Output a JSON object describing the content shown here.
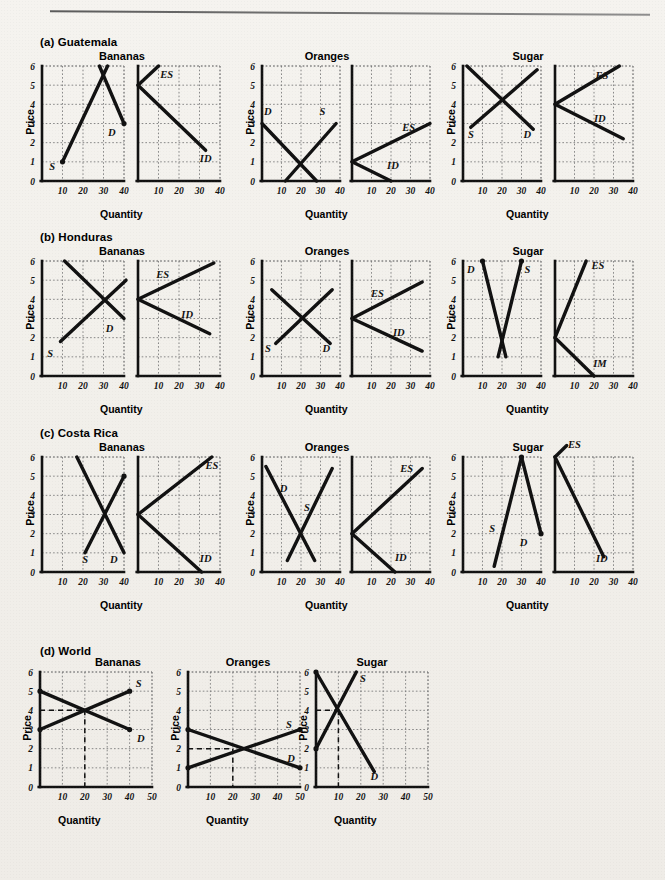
{
  "figure": {
    "top_rule": true,
    "rows": [
      {
        "id": "a",
        "label": "(a) Guatemala",
        "groups": [
          {
            "title": "Bananas",
            "xlabel": "Quantity",
            "ylabel": "Price"
          },
          {
            "title": "Oranges",
            "xlabel": "Quantity",
            "ylabel": "Price"
          },
          {
            "title": "Sugar",
            "xlabel": "Quantity",
            "ylabel": "Price"
          }
        ]
      },
      {
        "id": "b",
        "label": "(b) Honduras",
        "groups": [
          {
            "title": "Bananas",
            "xlabel": "Quantity",
            "ylabel": "Price"
          },
          {
            "title": "Oranges",
            "xlabel": "Quantity",
            "ylabel": "Price"
          },
          {
            "title": "Sugar",
            "xlabel": "Quantity",
            "ylabel": "Price"
          }
        ]
      },
      {
        "id": "c",
        "label": "(c) Costa Rica",
        "groups": [
          {
            "title": "Bananas",
            "xlabel": "Quantity",
            "ylabel": "Price"
          },
          {
            "title": "Oranges",
            "xlabel": "Quantity",
            "ylabel": "Price"
          },
          {
            "title": "Sugar",
            "xlabel": "Quantity",
            "ylabel": "Price"
          }
        ]
      },
      {
        "id": "d",
        "label": "(d) World",
        "groups": [
          {
            "title": "Bananas",
            "xlabel": "Quantity",
            "ylabel": "Price"
          },
          {
            "title": "Oranges",
            "xlabel": "Quantity",
            "ylabel": "Price"
          },
          {
            "title": "Sugar",
            "xlabel": "Quantity",
            "ylabel": "Price"
          }
        ]
      }
    ],
    "axes": {
      "yticks": [
        0,
        1,
        2,
        3,
        4,
        5,
        6
      ],
      "xticks_40": [
        10,
        20,
        30,
        40
      ],
      "xticks_50": [
        10,
        20,
        30,
        40,
        50
      ]
    },
    "curve_labels": {
      "S": "S",
      "D": "D",
      "ES": "ES",
      "ID": "ID",
      "IM": "IM"
    },
    "colors": {
      "ink": "#111111",
      "grid": "#7c7c7c",
      "paper": "#f2f0eb"
    }
  },
  "chart_data": {
    "type": "line",
    "xlabel": "Quantity",
    "ylabel": "Price",
    "ylim": [
      0,
      6
    ],
    "xlim_country": [
      0,
      40
    ],
    "xlim_world": [
      0,
      50
    ],
    "grid": true,
    "panels": [
      {
        "row": "(a) Guatemala",
        "good": "Bananas",
        "kind": "domestic",
        "xlim": [
          0,
          40
        ],
        "series": [
          {
            "name": "S",
            "label": "S",
            "points": [
              [
                10,
                1
              ],
              [
                32,
                6
              ]
            ]
          },
          {
            "name": "D",
            "label": "D",
            "points": [
              [
                28,
                6
              ],
              [
                40,
                3
              ]
            ]
          }
        ],
        "equilibrium": [
          30,
          5
        ]
      },
      {
        "row": "(a) Guatemala",
        "good": "Bananas",
        "kind": "trade",
        "xlim": [
          0,
          40
        ],
        "series": [
          {
            "name": "ES",
            "label": "ES",
            "points": [
              [
                0,
                5
              ],
              [
                10,
                6
              ]
            ]
          },
          {
            "name": "ID",
            "label": "ID",
            "points": [
              [
                0,
                5
              ],
              [
                33,
                1.6
              ]
            ]
          }
        ],
        "autarky_price": 5
      },
      {
        "row": "(a) Guatemala",
        "good": "Oranges",
        "kind": "domestic",
        "xlim": [
          0,
          40
        ],
        "series": [
          {
            "name": "D",
            "label": "D",
            "points": [
              [
                0,
                3
              ],
              [
                28,
                0
              ]
            ]
          },
          {
            "name": "S",
            "label": "S",
            "points": [
              [
                12,
                0
              ],
              [
                38,
                3
              ]
            ]
          }
        ],
        "equilibrium": [
          20,
          1
        ]
      },
      {
        "row": "(a) Guatemala",
        "good": "Oranges",
        "kind": "trade",
        "xlim": [
          0,
          40
        ],
        "series": [
          {
            "name": "ES",
            "label": "ES",
            "points": [
              [
                0,
                1
              ],
              [
                40,
                3
              ]
            ]
          },
          {
            "name": "ID",
            "label": "ID",
            "points": [
              [
                0,
                1
              ],
              [
                20,
                0
              ]
            ]
          }
        ],
        "autarky_price": 1
      },
      {
        "row": "(a) Guatemala",
        "good": "Sugar",
        "kind": "domestic",
        "xlim": [
          0,
          40
        ],
        "series": [
          {
            "name": "D",
            "label": "D",
            "points": [
              [
                2,
                6
              ],
              [
                36,
                2.7
              ]
            ]
          },
          {
            "name": "S",
            "label": "S",
            "points": [
              [
                4,
                2.8
              ],
              [
                38,
                5.8
              ]
            ]
          }
        ],
        "equilibrium": [
          20,
          4
        ]
      },
      {
        "row": "(a) Guatemala",
        "good": "Sugar",
        "kind": "trade",
        "xlim": [
          0,
          40
        ],
        "series": [
          {
            "name": "ES",
            "label": "ES",
            "points": [
              [
                0,
                4
              ],
              [
                33,
                6
              ]
            ]
          },
          {
            "name": "ID",
            "label": "ID",
            "points": [
              [
                0,
                4
              ],
              [
                35,
                2.2
              ]
            ]
          }
        ],
        "autarky_price": 4
      },
      {
        "row": "(b) Honduras",
        "good": "Bananas",
        "kind": "domestic",
        "xlim": [
          0,
          40
        ],
        "series": [
          {
            "name": "D",
            "label": "D",
            "points": [
              [
                11,
                6
              ],
              [
                40,
                3
              ]
            ]
          },
          {
            "name": "S",
            "label": "S",
            "points": [
              [
                9,
                1.8
              ],
              [
                41,
                5
              ]
            ]
          }
        ],
        "equilibrium": [
          30,
          4
        ]
      },
      {
        "row": "(b) Honduras",
        "good": "Bananas",
        "kind": "trade",
        "xlim": [
          0,
          40
        ],
        "series": [
          {
            "name": "ES",
            "label": "ES",
            "points": [
              [
                0,
                4
              ],
              [
                37,
                5.9
              ]
            ]
          },
          {
            "name": "ID",
            "label": "ID",
            "points": [
              [
                0,
                4
              ],
              [
                35,
                2.2
              ]
            ]
          }
        ],
        "autarky_price": 4
      },
      {
        "row": "(b) Honduras",
        "good": "Oranges",
        "kind": "domestic",
        "xlim": [
          0,
          40
        ],
        "series": [
          {
            "name": "D",
            "label": "D",
            "points": [
              [
                5,
                4.5
              ],
              [
                35,
                1.7
              ]
            ]
          },
          {
            "name": "S",
            "label": "S",
            "points": [
              [
                7,
                1.7
              ],
              [
                36,
                4.5
              ]
            ]
          }
        ],
        "equilibrium": [
          20,
          3
        ]
      },
      {
        "row": "(b) Honduras",
        "good": "Oranges",
        "kind": "trade",
        "xlim": [
          0,
          40
        ],
        "series": [
          {
            "name": "ES",
            "label": "ES",
            "points": [
              [
                0,
                3
              ],
              [
                36,
                4.9
              ]
            ]
          },
          {
            "name": "ID",
            "label": "ID",
            "points": [
              [
                0,
                3
              ],
              [
                36,
                1.3
              ]
            ]
          }
        ],
        "autarky_price": 3
      },
      {
        "row": "(b) Honduras",
        "good": "Sugar",
        "kind": "domestic",
        "xlim": [
          0,
          40
        ],
        "series": [
          {
            "name": "D",
            "label": "D",
            "points": [
              [
                10,
                6
              ],
              [
                22,
                1
              ]
            ]
          },
          {
            "name": "S",
            "label": "S",
            "points": [
              [
                30,
                6
              ],
              [
                18,
                1
              ]
            ]
          }
        ],
        "equilibrium": [
          20,
          2
        ]
      },
      {
        "row": "(b) Honduras",
        "good": "Sugar",
        "kind": "trade",
        "xlim": [
          0,
          40
        ],
        "series": [
          {
            "name": "ES",
            "label": "ES",
            "points": [
              [
                0,
                2
              ],
              [
                16,
                6
              ]
            ]
          },
          {
            "name": "IM",
            "label": "IM",
            "points": [
              [
                0,
                2
              ],
              [
                20,
                0
              ]
            ]
          }
        ],
        "autarky_price": 2
      },
      {
        "row": "(c) Costa Rica",
        "good": "Bananas",
        "kind": "domestic",
        "xlim": [
          0,
          40
        ],
        "series": [
          {
            "name": "D",
            "label": "D",
            "points": [
              [
                17,
                6
              ],
              [
                40,
                1
              ]
            ]
          },
          {
            "name": "S",
            "label": "S",
            "points": [
              [
                21,
                1
              ],
              [
                40,
                5
              ]
            ]
          }
        ],
        "equilibrium": [
          30,
          3
        ]
      },
      {
        "row": "(c) Costa Rica",
        "good": "Bananas",
        "kind": "trade",
        "xlim": [
          0,
          40
        ],
        "series": [
          {
            "name": "ES",
            "label": "ES",
            "points": [
              [
                0,
                3
              ],
              [
                36,
                6
              ]
            ]
          },
          {
            "name": "ID",
            "label": "ID",
            "points": [
              [
                0,
                3
              ],
              [
                31,
                0
              ]
            ]
          }
        ],
        "autarky_price": 3
      },
      {
        "row": "(c) Costa Rica",
        "good": "Oranges",
        "kind": "domestic",
        "xlim": [
          0,
          40
        ],
        "series": [
          {
            "name": "D",
            "label": "D",
            "points": [
              [
                2,
                5.5
              ],
              [
                27,
                0.6
              ]
            ]
          },
          {
            "name": "S",
            "label": "S",
            "points": [
              [
                13,
                0.6
              ],
              [
                36,
                5.4
              ]
            ]
          }
        ],
        "equilibrium": [
          20,
          2
        ]
      },
      {
        "row": "(c) Costa Rica",
        "good": "Oranges",
        "kind": "trade",
        "xlim": [
          0,
          40
        ],
        "series": [
          {
            "name": "ES",
            "label": "ES",
            "points": [
              [
                0,
                2
              ],
              [
                36,
                5.4
              ]
            ]
          },
          {
            "name": "ID",
            "label": "ID",
            "points": [
              [
                0,
                2
              ],
              [
                22,
                0
              ]
            ]
          }
        ],
        "autarky_price": 2
      },
      {
        "row": "(c) Costa Rica",
        "good": "Sugar",
        "kind": "domestic",
        "xlim": [
          0,
          40
        ],
        "series": [
          {
            "name": "S",
            "label": "S",
            "points": [
              [
                16,
                0.3
              ],
              [
                30,
                6
              ]
            ]
          },
          {
            "name": "D",
            "label": "D",
            "points": [
              [
                30,
                6
              ],
              [
                40,
                2
              ]
            ]
          }
        ],
        "equilibrium": [
          30,
          6
        ]
      },
      {
        "row": "(c) Costa Rica",
        "good": "Sugar",
        "kind": "trade",
        "xlim": [
          0,
          40
        ],
        "series": [
          {
            "name": "ES",
            "label": "ES",
            "points": [
              [
                0,
                6
              ],
              [
                6,
                6.6
              ]
            ]
          },
          {
            "name": "ID",
            "label": "ID",
            "points": [
              [
                0,
                6
              ],
              [
                25,
                0.8
              ]
            ]
          }
        ],
        "autarky_price": 6
      },
      {
        "row": "(d) World",
        "good": "Bananas",
        "kind": "world",
        "xlim": [
          0,
          50
        ],
        "series": [
          {
            "name": "D",
            "label": "D",
            "points": [
              [
                0,
                5
              ],
              [
                40,
                3
              ]
            ]
          },
          {
            "name": "S",
            "label": "S",
            "points": [
              [
                0,
                3
              ],
              [
                40,
                5
              ]
            ]
          }
        ],
        "equilibrium": [
          20,
          4
        ],
        "guides": [
          "horizontal at P=4",
          "vertical at Q=20"
        ]
      },
      {
        "row": "(d) World",
        "good": "Oranges",
        "kind": "world",
        "xlim": [
          0,
          50
        ],
        "series": [
          {
            "name": "D",
            "label": "D",
            "points": [
              [
                0,
                3
              ],
              [
                50,
                1
              ]
            ]
          },
          {
            "name": "S",
            "label": "S",
            "points": [
              [
                0,
                1
              ],
              [
                50,
                3
              ]
            ]
          }
        ],
        "equilibrium": [
          20,
          2
        ],
        "guides": [
          "horizontal at P=2",
          "vertical at Q=20"
        ]
      },
      {
        "row": "(d) World",
        "good": "Sugar",
        "kind": "world",
        "xlim": [
          0,
          50
        ],
        "series": [
          {
            "name": "D",
            "label": "D",
            "points": [
              [
                0,
                6
              ],
              [
                26,
                0.8
              ]
            ]
          },
          {
            "name": "S",
            "label": "S",
            "points": [
              [
                0,
                2
              ],
              [
                18,
                6
              ]
            ]
          }
        ],
        "equilibrium": [
          10,
          4
        ],
        "guides": [
          "horizontal at P=4",
          "vertical at Q=10"
        ]
      }
    ]
  }
}
